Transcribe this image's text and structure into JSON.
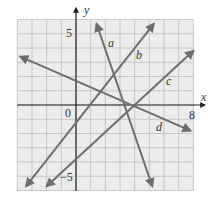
{
  "chart_data": {
    "type": "line",
    "title": "",
    "xlabel": "x",
    "ylabel": "y",
    "xlim": [
      -4,
      8
    ],
    "ylim": [
      -6,
      6
    ],
    "grid": true,
    "tick_labels": {
      "origin": "0",
      "x_max": "8",
      "y_pos": "5",
      "y_neg": "−5"
    },
    "series": [
      {
        "name": "a",
        "points": [
          [
            1.4,
            5.7
          ],
          [
            5.2,
            -5.7
          ]
        ]
      },
      {
        "name": "b",
        "points": [
          [
            -3.4,
            -5.7
          ],
          [
            5.3,
            5.7
          ]
        ]
      },
      {
        "name": "c",
        "points": [
          [
            -2.0,
            -5.7
          ],
          [
            8.0,
            3.8
          ]
        ]
      },
      {
        "name": "d",
        "points": [
          [
            -3.8,
            3.4
          ],
          [
            7.8,
            -1.8
          ]
        ]
      }
    ],
    "line_color": "#6e6e6e",
    "grid_color": "#bdbdbd",
    "background": "#ececec"
  },
  "labels": {
    "x_axis": "x",
    "y_axis": "y",
    "origin": "0",
    "x8": "8",
    "y5": "5",
    "yneg5": "−5",
    "a": "a",
    "b": "b",
    "c": "c",
    "d": "d"
  }
}
